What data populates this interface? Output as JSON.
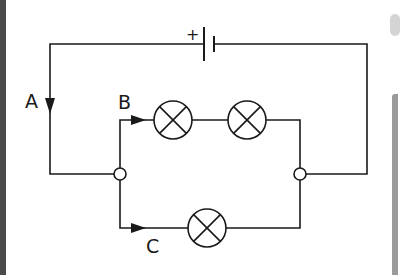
{
  "diagram": {
    "type": "circuit",
    "labels": {
      "a": "A",
      "b": "B",
      "c": "C",
      "battery_positive": "+"
    },
    "components": {
      "battery": {
        "count": 1,
        "polarity_mark": "+"
      },
      "lamps": [
        {
          "branch": "upper",
          "position": 1
        },
        {
          "branch": "upper",
          "position": 2
        },
        {
          "branch": "lower",
          "position": 1
        }
      ],
      "junctions": 2
    },
    "current_arrows": [
      {
        "label": "A",
        "direction": "down",
        "location": "main wire"
      },
      {
        "label": "B",
        "direction": "right",
        "location": "upper branch"
      },
      {
        "label": "C",
        "direction": "right",
        "location": "lower branch"
      }
    ],
    "colors": {
      "wire": "#1a1a1a",
      "background": "#ffffff"
    }
  }
}
